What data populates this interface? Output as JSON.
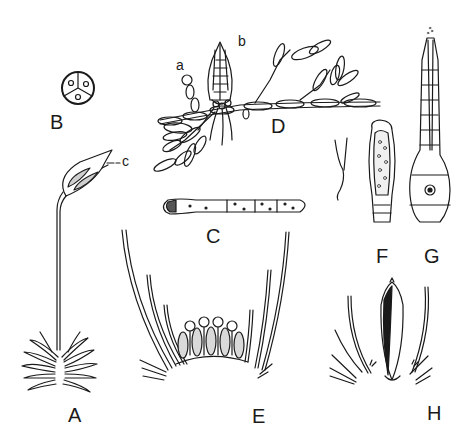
{
  "figure": {
    "panel_labels": {
      "A": "A",
      "B": "B",
      "C": "C",
      "D": "D",
      "E": "E",
      "F": "F",
      "G": "G",
      "H": "H"
    },
    "sub_labels": {
      "a": "a",
      "b": "b",
      "c": "c"
    },
    "colors": {
      "ink": "#1a1a1a",
      "background": "#ffffff"
    }
  }
}
